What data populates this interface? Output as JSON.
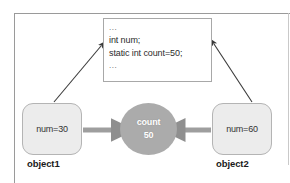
{
  "diagram": {
    "code_box": {
      "name": "class-body-code-box",
      "lines": [
        "...",
        "int num;",
        "static int count=50;",
        "..."
      ]
    },
    "objects": [
      {
        "id": "object1",
        "value_text": "num=30",
        "label": "object1"
      },
      {
        "id": "object2",
        "value_text": "num=60",
        "label": "object2"
      }
    ],
    "static_field": {
      "name_text": "count",
      "value_text": "50"
    },
    "arrows": {
      "object1_to_static": "thick-right-arrow",
      "object2_to_static": "thick-left-arrow",
      "object1_to_code": "thin-diagonal-arrow",
      "object2_to_code": "thin-diagonal-arrow"
    },
    "colors": {
      "background": "#ffffff",
      "frame_border": "#9a9a9a",
      "code_border": "#a8a8a8",
      "code_text": "#2c2c2c",
      "object_fill": "#ececec",
      "object_border": "#b4b4b4",
      "object_text": "#333333",
      "label_text": "#1a1a1a",
      "ellipse_fill": "#ababab",
      "ellipse_text": "#ffffff",
      "thick_arrow": "#9e9e9e",
      "thin_arrow": "#3a3a3a"
    }
  }
}
